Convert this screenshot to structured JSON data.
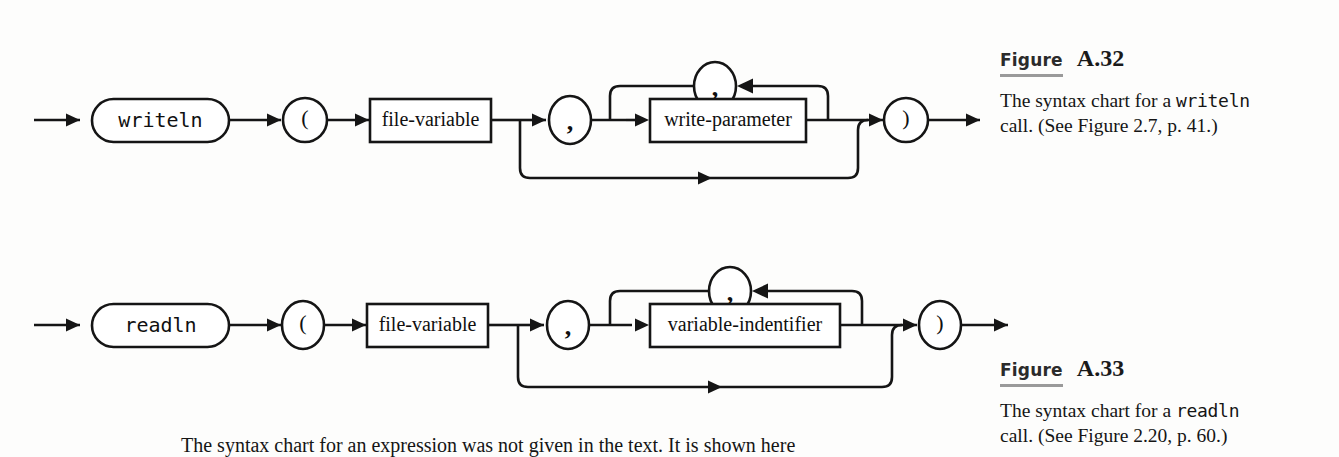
{
  "page": {
    "background": "#fdfdfc",
    "ink": "#151515"
  },
  "diagrams": [
    {
      "id": "writeln-syntax-chart",
      "kind": "railroad-syntax-chart",
      "entry_label": "",
      "nodes": [
        {
          "name": "keyword-writeln",
          "shape": "stadium",
          "label": "writeln",
          "font": "mono"
        },
        {
          "name": "open-paren",
          "shape": "circle",
          "label": "(",
          "font": "serif"
        },
        {
          "name": "file-variable",
          "shape": "box",
          "label": "file-variable",
          "font": "serif"
        },
        {
          "name": "comma-separator",
          "shape": "circle",
          "label": ",",
          "font": "serif"
        },
        {
          "name": "write-parameter",
          "shape": "box",
          "label": "write-parameter",
          "font": "serif"
        },
        {
          "name": "loop-comma",
          "shape": "circle",
          "label": ",",
          "font": "serif"
        },
        {
          "name": "close-paren",
          "shape": "circle",
          "label": ")",
          "font": "serif"
        }
      ],
      "paths": [
        "main-entry-arrow",
        "repeat-loop-back-edge",
        "bypass-skip-edge",
        "main-exit-arrow"
      ]
    },
    {
      "id": "readln-syntax-chart",
      "kind": "railroad-syntax-chart",
      "entry_label": "",
      "nodes": [
        {
          "name": "keyword-readln",
          "shape": "stadium",
          "label": "readln",
          "font": "mono"
        },
        {
          "name": "open-paren",
          "shape": "circle",
          "label": "(",
          "font": "serif"
        },
        {
          "name": "file-variable",
          "shape": "box",
          "label": "file-variable",
          "font": "serif"
        },
        {
          "name": "comma-separator",
          "shape": "circle",
          "label": ",",
          "font": "serif"
        },
        {
          "name": "variable-indentifier",
          "shape": "box",
          "label": "variable-indentifier",
          "font": "serif"
        },
        {
          "name": "loop-comma",
          "shape": "circle",
          "label": ",",
          "font": "serif"
        },
        {
          "name": "close-paren",
          "shape": "circle",
          "label": ")",
          "font": "serif"
        }
      ],
      "paths": [
        "main-entry-arrow",
        "repeat-loop-back-edge",
        "bypass-skip-edge",
        "main-exit-arrow"
      ]
    }
  ],
  "captions": {
    "a32": {
      "word": "Figure",
      "number": "A.32",
      "body_part1": "The syntax chart for a ",
      "body_mono": "writeln",
      "body_part2": " call. (See Figure 2.7, p. 41.)"
    },
    "a33": {
      "word": "Figure",
      "number": "A.33",
      "body_part1": "The syntax chart for a ",
      "body_mono": "readln",
      "body_part2": " call. (See Figure 2.20, p. 60.)"
    }
  },
  "body_text": {
    "paragraph": "The syntax chart for an expression was not given in the text. It is shown here"
  }
}
